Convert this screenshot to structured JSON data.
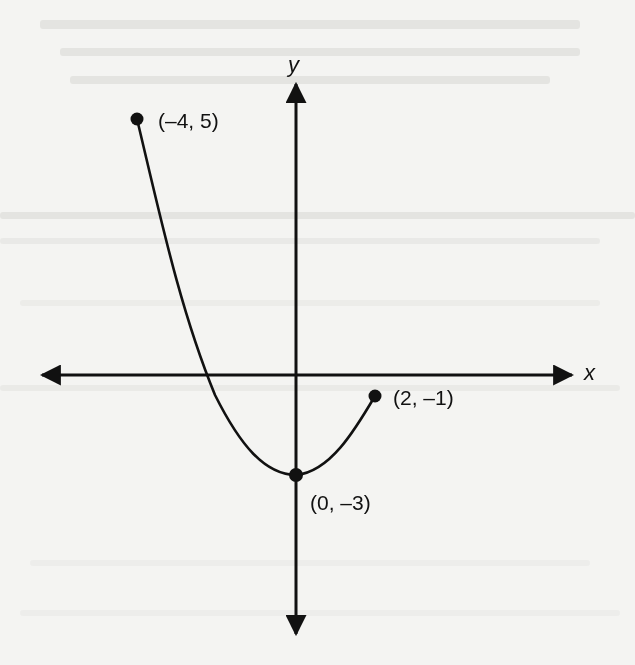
{
  "diagram": {
    "axes": {
      "x_label": "x",
      "y_label": "y"
    },
    "points": [
      {
        "label": "(–4, 5)",
        "x": -4,
        "y": 5
      },
      {
        "label": "(0, –3)",
        "x": 0,
        "y": -3
      },
      {
        "label": "(2, –1)",
        "x": 2,
        "y": -1
      }
    ],
    "curve": {
      "description": "Parabola-shaped graph of a function from (-4, 5) down to minimum (0, -3) and up to (2, -1), with closed endpoints",
      "domain": [
        -4,
        2
      ],
      "range": [
        -3,
        5
      ],
      "minimum": {
        "x": 0,
        "y": -3
      },
      "endpoints_closed": true
    },
    "colors": {
      "ink": "#111111",
      "paper": "#f4f4f2"
    }
  }
}
